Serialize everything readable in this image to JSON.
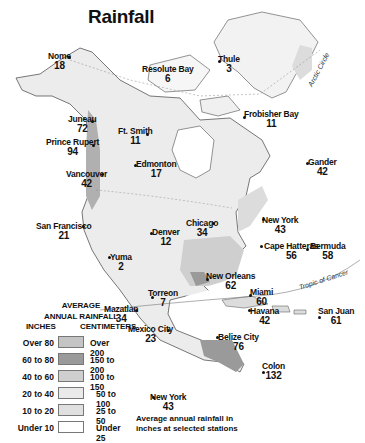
{
  "title": "Rainfall",
  "legend": {
    "heading_line1": "AVERAGE",
    "heading_line2": "ANNUAL RAINFALL",
    "inches_header": "INCHES",
    "cm_header": "CENTIMETERS",
    "rows": [
      {
        "inches": "Over 80",
        "cm": "Over 200",
        "color": "#c4c4c4"
      },
      {
        "inches": "60 to 80",
        "cm": "150 to 200",
        "color": "#9a9a9a"
      },
      {
        "inches": "40 to 60",
        "cm": "100 to 150",
        "color": "#cfcfcf"
      },
      {
        "inches": "20 to 40",
        "cm": "50 to 100",
        "color": "#eaeaea"
      },
      {
        "inches": "10 to 20",
        "cm": "25 to 50",
        "color": "#e0e0e0"
      },
      {
        "inches": "Under 10",
        "cm": "Under 25",
        "color": "#ffffff"
      }
    ]
  },
  "key_example": {
    "name": "New York",
    "value": "43"
  },
  "key_note_line1": "Average annual rainfall in",
  "key_note_line2": "inches at selected stations",
  "labels": {
    "arctic_circle": "Arctic Circle",
    "tropic_of_cancer": "Tropic of Cancer"
  },
  "stations": [
    {
      "name": "Nome",
      "value": "18"
    },
    {
      "name": "Resolute Bay",
      "value": "6"
    },
    {
      "name": "Thule",
      "value": "3"
    },
    {
      "name": "Frobisher Bay",
      "value": "11"
    },
    {
      "name": "Juneau",
      "value": "72"
    },
    {
      "name": "Ft. Smith",
      "value": "11"
    },
    {
      "name": "Prince Rupert",
      "value": "94"
    },
    {
      "name": "Edmonton",
      "value": "17"
    },
    {
      "name": "Gander",
      "value": "42"
    },
    {
      "name": "Vancouver",
      "value": "42"
    },
    {
      "name": "New York",
      "value": "43"
    },
    {
      "name": "San Francisco",
      "value": "21"
    },
    {
      "name": "Chicago",
      "value": "34"
    },
    {
      "name": "Denver",
      "value": "12"
    },
    {
      "name": "Cape Hatteras",
      "value": "56"
    },
    {
      "name": "Bermuda",
      "value": "58"
    },
    {
      "name": "Yuma",
      "value": "2"
    },
    {
      "name": "New Orleans",
      "value": "62"
    },
    {
      "name": "Miami",
      "value": "60"
    },
    {
      "name": "Torreon",
      "value": "7"
    },
    {
      "name": "Havana",
      "value": "42"
    },
    {
      "name": "San Juan",
      "value": "61"
    },
    {
      "name": "Mazatlan",
      "value": "34"
    },
    {
      "name": "Mexico City",
      "value": "23"
    },
    {
      "name": "Belize City",
      "value": "76"
    },
    {
      "name": "Colon",
      "value": "132"
    }
  ]
}
